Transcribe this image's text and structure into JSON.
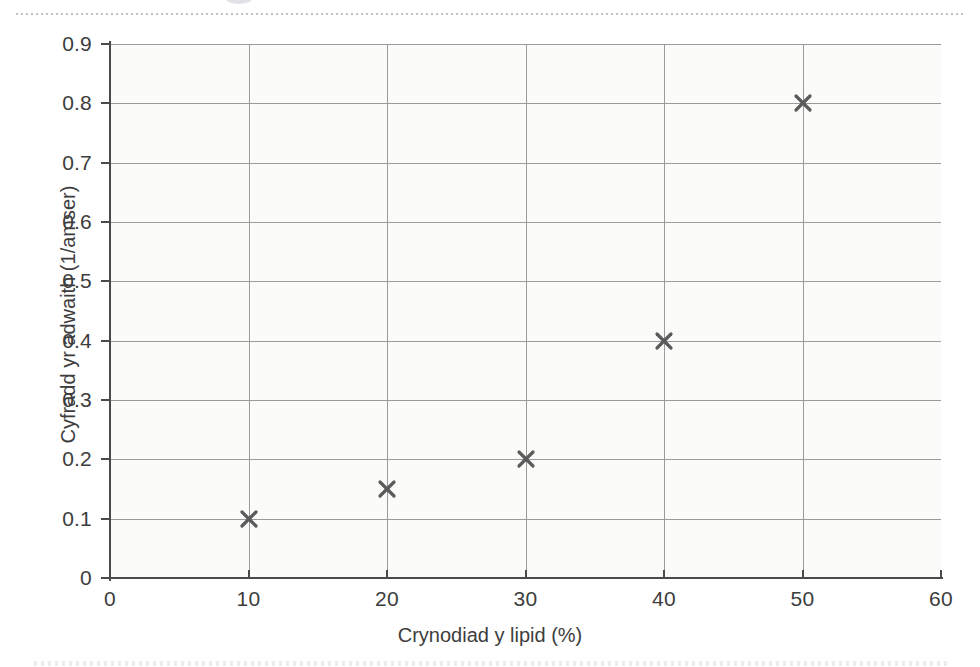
{
  "figure": {
    "background_color": "#ffffff",
    "plot_background_color": "#fbfbfa",
    "grid_color": "#9a9a9a",
    "axis_color": "#4a4a4a",
    "marker_color": "#5b5b5b"
  },
  "chart_data": {
    "type": "scatter",
    "title": "",
    "xlabel": "Crynodiad y lipid (%)",
    "ylabel": "Cyfradd yr adwaith (1/amser)",
    "xlim": [
      0,
      60
    ],
    "ylim": [
      0,
      0.9
    ],
    "grid": true,
    "legend": "none",
    "marker": "x",
    "x_ticks": [
      0,
      10,
      20,
      30,
      40,
      50,
      60
    ],
    "x_tick_labels": [
      "0",
      "10",
      "20",
      "30",
      "40",
      "50",
      "60"
    ],
    "y_ticks": [
      0,
      0.1,
      0.2,
      0.3,
      0.4,
      0.5,
      0.6,
      0.7,
      0.8,
      0.9
    ],
    "y_tick_labels": [
      "0",
      "0.1",
      "0.2",
      "0.3",
      "0.4",
      "0.5",
      "0.6",
      "0.7",
      "0.8",
      "0.9"
    ],
    "x": [
      10,
      20,
      30,
      40,
      50
    ],
    "y": [
      0.1,
      0.15,
      0.2,
      0.4,
      0.8
    ],
    "points": [
      {
        "x": 10,
        "y": 0.1
      },
      {
        "x": 20,
        "y": 0.15
      },
      {
        "x": 30,
        "y": 0.2
      },
      {
        "x": 40,
        "y": 0.4
      },
      {
        "x": 50,
        "y": 0.8
      }
    ]
  }
}
